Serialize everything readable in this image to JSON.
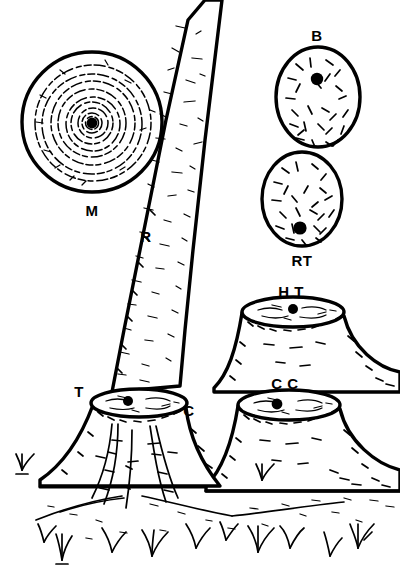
{
  "figure": {
    "background_color": "#ffffff",
    "ink_color": "#000000",
    "width": 400,
    "height": 572
  },
  "labels": {
    "m": "M",
    "r": "R",
    "b": "B",
    "rt": "RT",
    "ht": "H T",
    "cc": "C C",
    "t": "T",
    "c": "C"
  },
  "parts": [
    {
      "id": "m-disc",
      "label": "M",
      "description": "Large circular cross-section disc showing concentric annual growth rings with central pith",
      "label_x": 92,
      "label_y": 212
    },
    {
      "id": "r-trunk",
      "label": "R",
      "description": "Tall leaning trunk with vertical bark texture",
      "label_x": 146,
      "label_y": 238
    },
    {
      "id": "b-oval",
      "label": "B",
      "description": "Small oval cross-section with scattered short marks and off-centre dot near top",
      "label_x": 317,
      "label_y": 37
    },
    {
      "id": "rt-oval",
      "label": "RT",
      "description": "Small oval cross-section with scattered short marks and off-centre dot near bottom",
      "label_x": 302,
      "label_y": 262
    },
    {
      "id": "ht-stump",
      "label": "H T",
      "description": "Upper right stump with flared base and elliptical cut top bearing a dot",
      "label_x": 291,
      "label_y": 293
    },
    {
      "id": "cc-stump",
      "label": "C C",
      "description": "Lower right stump with flared base and elliptical cut top bearing a dot",
      "label_x": 285,
      "label_y": 385
    },
    {
      "id": "t-stump-left",
      "label": "T",
      "description": "Left stump cut top ellipse left marker",
      "label_x": 79,
      "label_y": 393
    },
    {
      "id": "c-stump-left",
      "label": "C",
      "description": "Left stump cut top ellipse right marker",
      "label_x": 189,
      "label_y": 412
    }
  ],
  "scene": {
    "ground_label": "ground line",
    "grass_tufts": 13,
    "stump_count": 3,
    "cross_section_count": 3
  }
}
